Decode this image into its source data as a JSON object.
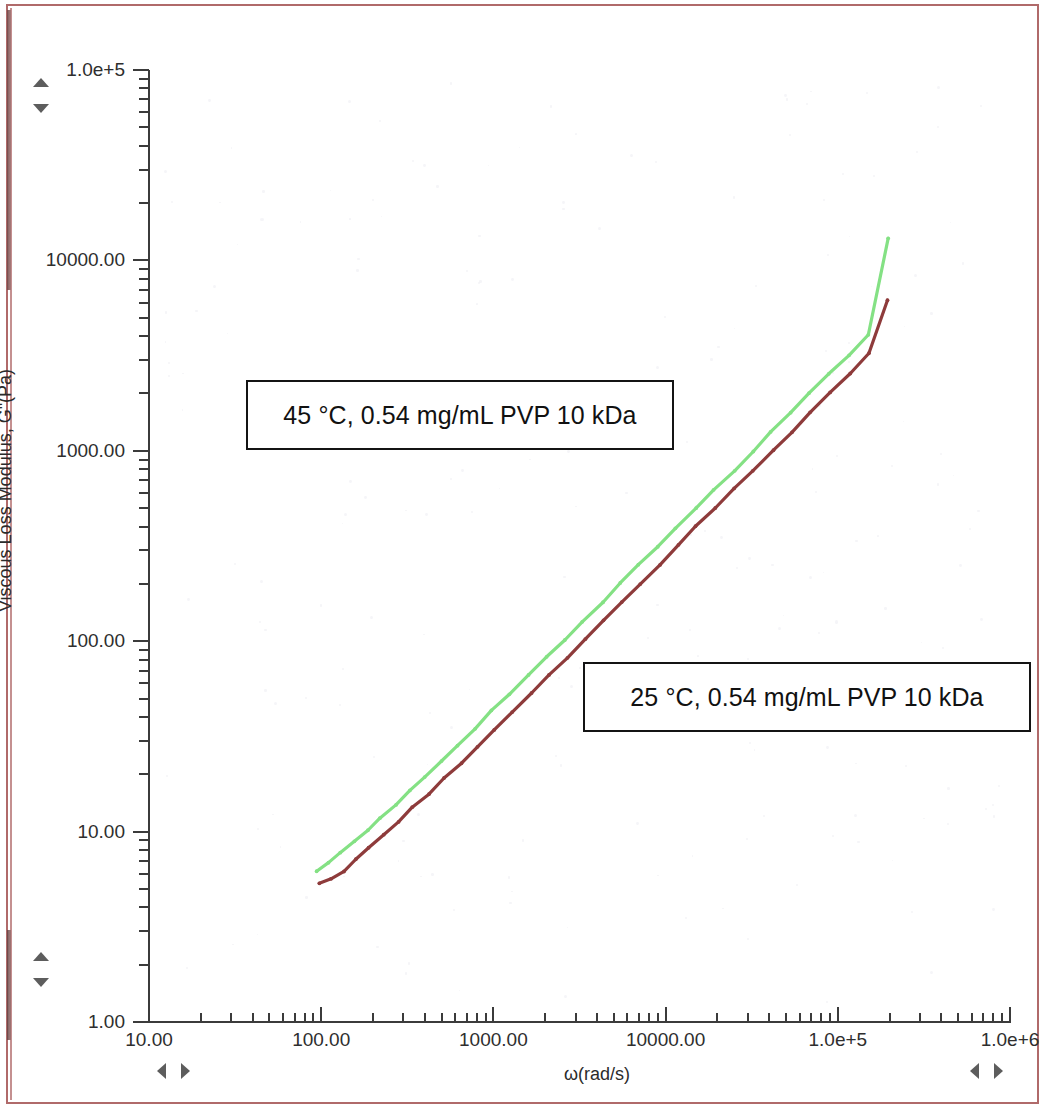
{
  "figure": {
    "axis_title_y": "Viscous Loss Modulus, Gʺ(Pa)",
    "axis_title_x": "ω(rad/s)"
  },
  "annotations": {
    "box_45c": "45 °C, 0.54 mg/mL PVP 10 kDa",
    "box_25c": "25 °C, 0.54 mg/mL PVP 10 kDa"
  },
  "y_tick_labels": [
    "1.0e+5",
    "10000.00",
    "1000.00",
    "100.00",
    "10.00",
    "1.00"
  ],
  "x_tick_labels": [
    "10.00",
    "100.00",
    "1000.00",
    "10000.00",
    "1.0e+5",
    "1.0e+6"
  ],
  "colors": {
    "series_45c": "#84e184",
    "series_25c": "#8e3b3b",
    "axis": "#3b3b3b",
    "page_border": "#b06a6a",
    "callout_border": "#141414"
  },
  "chart_data": {
    "type": "line",
    "title": "",
    "xlabel": "ω(rad/s)",
    "ylabel": "Viscous Loss Modulus, Gʺ(Pa)",
    "xscale": "log",
    "yscale": "log",
    "xlim": [
      10,
      1000000
    ],
    "ylim": [
      1,
      100000
    ],
    "grid": false,
    "legend_position": "annotation-boxes",
    "series": [
      {
        "name": "45 °C, 0.54 mg/mL PVP 10 kDa",
        "color": "#84e184",
        "x": [
          95,
          110,
          130,
          155,
          185,
          220,
          270,
          330,
          400,
          500,
          620,
          780,
          980,
          1250,
          1600,
          2050,
          2600,
          3300,
          4300,
          5500,
          7000,
          9000,
          11500,
          15000,
          19000,
          25000,
          32000,
          41000,
          53000,
          68000,
          88000,
          115000,
          150000,
          195000
        ],
        "y": [
          6.2,
          6.9,
          7.8,
          8.9,
          10.2,
          11.8,
          13.9,
          16.5,
          19.5,
          23.5,
          28.5,
          35.0,
          43.0,
          53.0,
          66.0,
          82.0,
          102.0,
          127.0,
          160.0,
          200.0,
          250.0,
          315.0,
          395.0,
          500.0,
          620.0,
          790.0,
          990.0,
          1250.0,
          1570.0,
          1990.0,
          2520.0,
          3200.0,
          4100.0,
          13000.0
        ]
      },
      {
        "name": "25 °C, 0.54 mg/mL PVP 10 kDa",
        "color": "#8e3b3b",
        "x": [
          98,
          115,
          135,
          160,
          190,
          230,
          280,
          340,
          420,
          520,
          650,
          810,
          1020,
          1300,
          1650,
          2100,
          2700,
          3400,
          4400,
          5600,
          7200,
          9200,
          11800,
          15000,
          19500,
          25000,
          32000,
          42000,
          54000,
          69000,
          90000,
          118000,
          152000,
          196000
        ],
        "y": [
          5.3,
          5.6,
          6.2,
          7.1,
          8.3,
          9.7,
          11.3,
          13.3,
          15.8,
          19.0,
          23.0,
          28.0,
          34.5,
          42.5,
          53.0,
          66.0,
          82.0,
          102.0,
          128.0,
          160.0,
          200.0,
          252.0,
          318.0,
          400.0,
          500.0,
          630.0,
          790.0,
          1000.0,
          1260.0,
          1590.0,
          2010.0,
          2550.0,
          3250.0,
          6200.0
        ]
      }
    ]
  },
  "controls": {
    "y_scroll_top": "y-axis-scroll-top",
    "y_scroll_bottom": "y-axis-scroll-bottom",
    "x_scroll_left": "x-axis-scroll-left",
    "x_scroll_right": "x-axis-scroll-right"
  }
}
